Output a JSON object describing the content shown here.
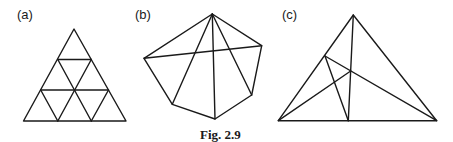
{
  "figure": {
    "caption": "Fig. 2.9",
    "panels": [
      {
        "label": "(a)",
        "description": "Equilateral triangle subdivided into 9 smaller triangles"
      },
      {
        "label": "(b)",
        "description": "Pentagon-like hexagon with diagonals from top vertex and one horizontal chord"
      },
      {
        "label": "(c)",
        "description": "Triangle with three cevians"
      }
    ]
  }
}
